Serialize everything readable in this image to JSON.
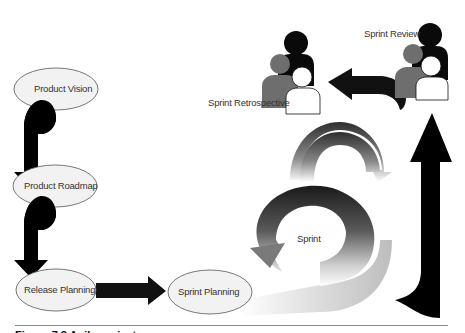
{
  "diagram": {
    "type": "scrum-flow",
    "nodes": {
      "product_vision": "Product Vision",
      "product_roadmap": "Product Roadmap",
      "release_planning": "Release Planning",
      "sprint_planning": "Sprint Planning",
      "sprint": "Sprint",
      "sprint_review": "Sprint Review",
      "sprint_retrospective": "Sprint Retrospective"
    },
    "flow": [
      "Product Vision",
      "Product Roadmap",
      "Release Planning",
      "Sprint Planning",
      "Sprint",
      "Sprint Review",
      "Sprint Retrospective"
    ]
  },
  "caption": {
    "text": "Figure 7.3  Agile project"
  },
  "colors": {
    "ellipse_fill": "#f2f2f2",
    "ellipse_stroke": "#555555",
    "arrow": "#000000",
    "person_dark": "#0a0a0a",
    "person_gray": "#6e6e6e",
    "person_white": "#ffffff"
  }
}
